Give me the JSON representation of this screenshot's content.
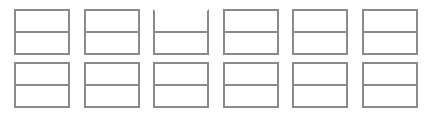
{
  "diagram": {
    "type": "box-grid",
    "rows": 2,
    "columns": 6,
    "line_color": "#8a8a8a",
    "background_color": "#ffffff",
    "cells": [
      {
        "row": 0,
        "col": 0,
        "top_border": true,
        "top_text": "",
        "bottom_text": ""
      },
      {
        "row": 0,
        "col": 1,
        "top_border": true,
        "top_text": "",
        "bottom_text": ""
      },
      {
        "row": 0,
        "col": 2,
        "top_border": false,
        "top_text": "",
        "bottom_text": ""
      },
      {
        "row": 0,
        "col": 3,
        "top_border": true,
        "top_text": "",
        "bottom_text": ""
      },
      {
        "row": 0,
        "col": 4,
        "top_border": true,
        "top_text": "",
        "bottom_text": ""
      },
      {
        "row": 0,
        "col": 5,
        "top_border": true,
        "top_text": "",
        "bottom_text": ""
      },
      {
        "row": 1,
        "col": 0,
        "top_border": true,
        "top_text": "",
        "bottom_text": ""
      },
      {
        "row": 1,
        "col": 1,
        "top_border": true,
        "top_text": "",
        "bottom_text": ""
      },
      {
        "row": 1,
        "col": 2,
        "top_border": true,
        "top_text": "",
        "bottom_text": ""
      },
      {
        "row": 1,
        "col": 3,
        "top_border": true,
        "top_text": "",
        "bottom_text": ""
      },
      {
        "row": 1,
        "col": 4,
        "top_border": true,
        "top_text": "",
        "bottom_text": ""
      },
      {
        "row": 1,
        "col": 5,
        "top_border": true,
        "top_text": "",
        "bottom_text": ""
      }
    ]
  }
}
